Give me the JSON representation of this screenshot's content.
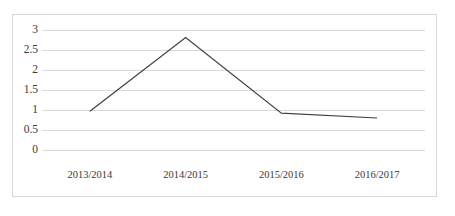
{
  "chart_data": {
    "type": "line",
    "title": "",
    "subtitle": "",
    "xlabel": "",
    "ylabel": "",
    "categories": [
      "2013/2014",
      "2014/2015",
      "2015/2016",
      "2016/2017"
    ],
    "series": [
      {
        "name": "series-1",
        "values": [
          0.97,
          2.81,
          0.92,
          0.8
        ],
        "color": "#404040",
        "line_width": 1.2,
        "markers": false
      }
    ],
    "ylim": [
      0,
      3
    ],
    "yticks": [
      0,
      0.5,
      1,
      1.5,
      2,
      2.5,
      3
    ],
    "ytick_labels": [
      "0",
      "0.5",
      "1",
      "1.5",
      "2",
      "2.5",
      "3"
    ],
    "grid": {
      "horizontal": true,
      "vertical": false,
      "color": "#d9d9d9"
    },
    "legend": {
      "visible": false,
      "position": "none",
      "entries": []
    },
    "frame": {
      "visible": true,
      "color": "#d8d8d8"
    },
    "annotations": []
  },
  "colors": {
    "line": "#404040",
    "grid": "#d9d9d9",
    "frame": "#d8d8d8",
    "text": "#3a3a3a",
    "background": "#ffffff"
  }
}
